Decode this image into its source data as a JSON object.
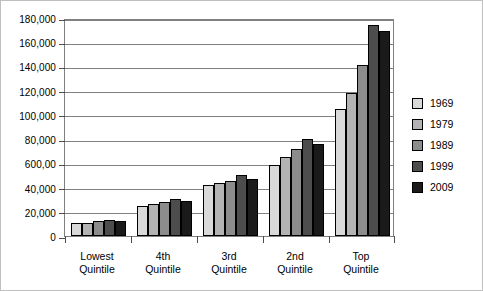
{
  "chart_data": {
    "type": "bar",
    "title": "",
    "xlabel": "",
    "ylabel": "",
    "ylim": [
      0,
      180000
    ],
    "grid": true,
    "legend_position": "right",
    "categories": [
      "Lowest\nQuintile",
      "4th\nQuintile",
      "3rd\nQuintile",
      "2nd\nQuintile",
      "Top\nQuintile"
    ],
    "category_lines": [
      [
        "Lowest",
        "Quintile"
      ],
      [
        "4th",
        "Quintile"
      ],
      [
        "3rd",
        "Quintile"
      ],
      [
        "2nd",
        "Quintile"
      ],
      [
        "Top",
        "Quintile"
      ]
    ],
    "ytick_values": [
      0,
      20000,
      40000,
      60000,
      80000,
      100000,
      120000,
      140000,
      160000,
      180000
    ],
    "ytick_labels": [
      "0",
      "20,000",
      "40,000",
      "600,00",
      "80,000",
      "100,000",
      "120,000",
      "140,000",
      "160,000",
      "180,000"
    ],
    "series": [
      {
        "name": "1969",
        "color": "#d9d9d9",
        "values": [
          10500,
          25000,
          42000,
          59000,
          105000
        ]
      },
      {
        "name": "1979",
        "color": "#b3b3b3",
        "values": [
          11000,
          26200,
          43500,
          65000,
          118000
        ]
      },
      {
        "name": "1989",
        "color": "#8c8c8c",
        "values": [
          12000,
          28000,
          45500,
          71500,
          141000
        ]
      },
      {
        "name": "1999",
        "color": "#4d4d4d",
        "values": [
          13000,
          30500,
          50000,
          80000,
          174000
        ]
      },
      {
        "name": "2009",
        "color": "#1a1a1a",
        "values": [
          12200,
          28500,
          47000,
          76000,
          169000
        ]
      }
    ]
  }
}
